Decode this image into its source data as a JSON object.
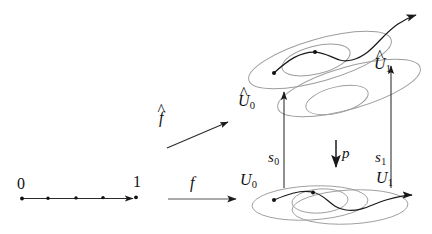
{
  "figure": {
    "colors": {
      "stroke_dark": "#1a1a1a",
      "stroke_light": "#9a9a9a",
      "background": "#ffffff"
    }
  },
  "interval": {
    "left_endpoint_label": "0",
    "right_endpoint_label": "1",
    "tick_count": 5
  },
  "maps": {
    "f_hat": {
      "base": "f",
      "accent": "^",
      "full": "f̂"
    },
    "f": {
      "base": "f",
      "accent": "",
      "full": "f"
    },
    "p": {
      "base": "p",
      "accent": "",
      "full": "p"
    },
    "s0": {
      "base": "s",
      "sub": "0",
      "full": "s₀"
    },
    "s1": {
      "base": "s",
      "sub": "1",
      "full": "s₁"
    }
  },
  "upstairs": {
    "sets": [
      {
        "base": "U",
        "accent": "^",
        "sub": "0",
        "full": "Û₀"
      },
      {
        "base": "U",
        "accent": "^",
        "sub": "1",
        "full": "Û₁"
      }
    ]
  },
  "downstairs": {
    "sets": [
      {
        "base": "U",
        "accent": "",
        "sub": "0",
        "full": "U₀"
      },
      {
        "base": "U",
        "accent": "",
        "sub": "1",
        "full": "U₁"
      }
    ]
  }
}
